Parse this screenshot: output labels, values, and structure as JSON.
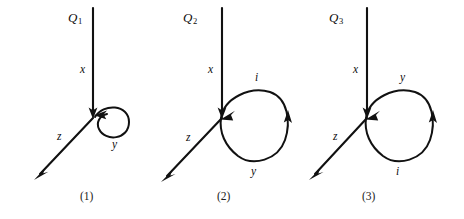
{
  "figure": {
    "background_color": "#ffffff",
    "stroke_color": "#111111",
    "text_color": "#0d0d0d",
    "panel_count": 3
  },
  "panels": [
    {
      "id": "panel-1",
      "charge_label": "Q",
      "charge_subscript": "1",
      "caption": "(1)",
      "axis_x_label": "x",
      "axis_z_label": "z",
      "loop_labels": [
        "y"
      ],
      "loop_style": "small-pinched-loop",
      "loop_label_top": "",
      "loop_label_bottom": "y"
    },
    {
      "id": "panel-2",
      "charge_label": "Q",
      "charge_subscript": "2",
      "caption": "(2)",
      "axis_x_label": "x",
      "axis_z_label": "z",
      "loop_labels": [
        "i",
        "y"
      ],
      "loop_style": "large-loop",
      "loop_label_top": "i",
      "loop_label_bottom": "y"
    },
    {
      "id": "panel-3",
      "charge_label": "Q",
      "charge_subscript": "3",
      "caption": "(3)",
      "axis_x_label": "x",
      "axis_z_label": "z",
      "loop_labels": [
        "y",
        "i"
      ],
      "loop_style": "large-loop",
      "loop_label_top": "y",
      "loop_label_bottom": "i"
    }
  ]
}
